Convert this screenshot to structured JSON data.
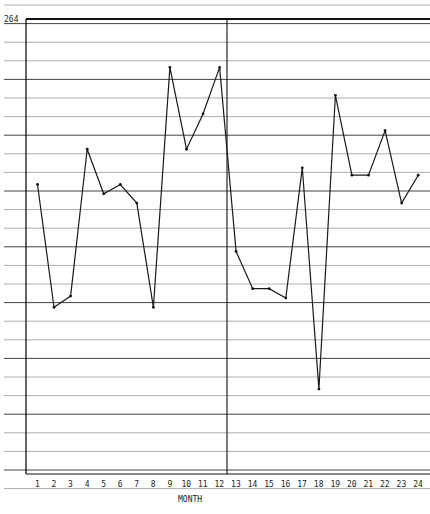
{
  "chart_data": {
    "type": "line",
    "title": "",
    "xlabel": "MONTH",
    "ylabel": "",
    "y_tick_labels": [
      "264"
    ],
    "categories": [
      "1",
      "2",
      "3",
      "4",
      "5",
      "6",
      "7",
      "8",
      "9",
      "10",
      "11",
      "12",
      "13",
      "14",
      "15",
      "16",
      "17",
      "18",
      "19",
      "20",
      "21",
      "22",
      "23",
      "24"
    ],
    "series": [
      {
        "name": "monthly value",
        "values": [
          255.1,
          248.5,
          249.1,
          257.0,
          254.6,
          255.1,
          254.1,
          248.5,
          261.4,
          257.0,
          258.9,
          261.4,
          251.5,
          249.5,
          249.5,
          249.0,
          256.0,
          244.1,
          259.9,
          255.6,
          255.6,
          258.0,
          254.1,
          255.6
        ]
      }
    ],
    "ylim": [
      239.6,
      264
    ],
    "grid": true,
    "vertical_divider_after_month": 12,
    "legend": null
  },
  "colors": {
    "line": "#1a1a1a",
    "grid": "#555555",
    "background": "#ffffff"
  }
}
